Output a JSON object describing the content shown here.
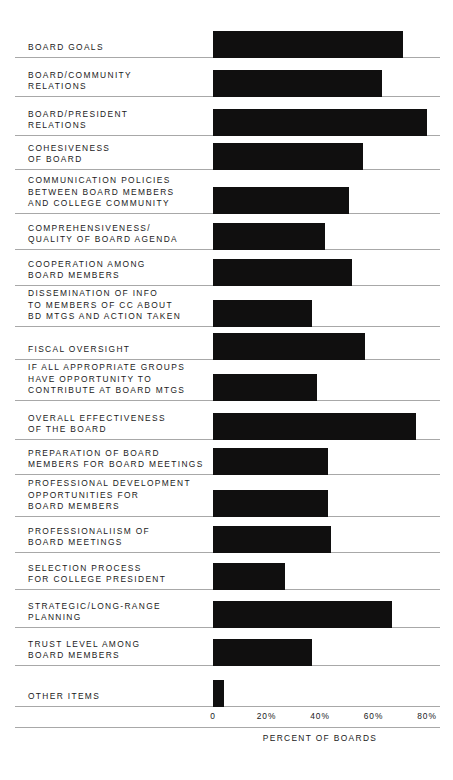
{
  "chart_data": {
    "type": "bar",
    "orientation": "horizontal",
    "title": "",
    "xlabel": "PERCENT OF BOARDS",
    "ylabel": "",
    "xlim": [
      0,
      85
    ],
    "grid": true,
    "legend": false,
    "tick_labels": [
      "0",
      "20%",
      "40%",
      "60%",
      "80%"
    ],
    "tick_values": [
      0,
      20,
      40,
      60,
      80
    ],
    "categories": [
      "BOARD GOALS",
      "BOARD/COMMUNITY\nRELATIONS",
      "BOARD/PRESIDENT\nRELATIONS",
      "COHESIVENESS\nOF BOARD",
      "COMMUNICATION POLICIES\nBETWEEN BOARD MEMBERS\nAND COLLEGE COMMUNITY",
      "COMPREHENSIVENESS/\nQUALITY OF BOARD AGENDA",
      "COOPERATION AMONG\nBOARD MEMBERS",
      "DISSEMINATION OF INFO\nTO MEMBERS OF CC ABOUT\nBD MTGS AND ACTION TAKEN",
      "FISCAL OVERSIGHT",
      "IF ALL APPROPRIATE GROUPS\nHAVE OPPORTUNITY TO\nCONTRIBUTE AT BOARD MTGS",
      "OVERALL EFFECTIVENESS\nOF THE BOARD",
      "PREPARATION OF BOARD\nMEMBERS FOR BOARD MEETINGS",
      "PROFESSIONAL DEVELOPMENT\nOPPORTUNITIES FOR\nBOARD MEMBERS",
      "PROFESSIONALIISM OF\nBOARD MEETINGS",
      "SELECTION PROCESS\nFOR COLLEGE PRESIDENT",
      "STRATEGIC/LONG-RANGE\nPLANNING",
      "TRUST LEVEL AMONG\nBOARD MEMBERS",
      "OTHER ITEMS"
    ],
    "values": [
      71,
      63,
      80,
      56,
      51,
      42,
      52,
      37,
      57,
      39,
      76,
      43,
      43,
      44,
      27,
      67,
      37,
      4
    ],
    "colors": {
      "bar": "#100f0f",
      "gridline": "#a8a8a8",
      "text": "#1a1a1a",
      "background": "#ffffff"
    }
  }
}
